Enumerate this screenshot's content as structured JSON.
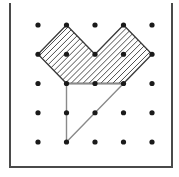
{
  "figure": {
    "canvas": {
      "width": 179,
      "height": 177,
      "background": "#ffffff"
    },
    "frame": {
      "name": "open-top-border",
      "left_x": 10,
      "right_x": 172,
      "top_y": 4,
      "bottom_y": 167,
      "color": "#4a4a4a",
      "stroke_width": 2,
      "top_edge_visible": false
    },
    "grid": {
      "rows": 5,
      "columns": 5,
      "origin_x": 38,
      "origin_y": 25,
      "spacing_x": 28.5,
      "spacing_y": 29.25,
      "dot_radius": 2.6,
      "dot_color": "#1a1a1a",
      "column_x": [
        38,
        66.5,
        95,
        123.5,
        152
      ],
      "row_y": [
        25,
        54.25,
        83.5,
        112.75,
        142
      ]
    },
    "hatch": {
      "angle_degrees": 45,
      "direction": "bottom-left-to-top-right",
      "spacing": 4.2,
      "color": "#2e2e2e",
      "stroke_width": 0.85
    },
    "shapes": [
      {
        "name": "hatched-heart-polygon",
        "kind": "polygon",
        "filled": "hatched",
        "outline_color": "#3a3a3a",
        "grid_vertices": [
          [
            0,
            1
          ],
          [
            1,
            0
          ],
          [
            2,
            1
          ],
          [
            3,
            0
          ],
          [
            4,
            1
          ],
          [
            3,
            2
          ],
          [
            1,
            2
          ]
        ],
        "points": [
          [
            38,
            54.25
          ],
          [
            66.5,
            25
          ],
          [
            95,
            54.25
          ],
          [
            123.5,
            25
          ],
          [
            152,
            54.25
          ],
          [
            123.5,
            83.5
          ],
          [
            66.5,
            83.5
          ]
        ]
      },
      {
        "name": "right-triangle",
        "kind": "polygon",
        "filled": "none",
        "outline_color": "#8a8a8a",
        "grid_vertices": [
          [
            1,
            2
          ],
          [
            3,
            2
          ],
          [
            1,
            4
          ]
        ],
        "points": [
          [
            66.5,
            83.5
          ],
          [
            123.5,
            83.5
          ],
          [
            66.5,
            142
          ]
        ]
      }
    ]
  }
}
